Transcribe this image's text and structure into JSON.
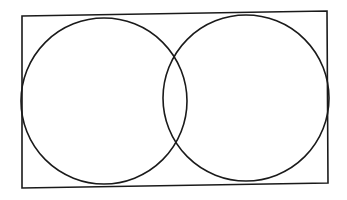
{
  "diagram": {
    "type": "venn-in-rectangle",
    "background": "#ffffff",
    "stroke": "#1a1a1a",
    "rectangle": {
      "points": "22,16 327,11 328,183 22,188"
    },
    "circles": [
      {
        "name": "left-circle",
        "cx": 104,
        "cy": 101,
        "r": 83
      },
      {
        "name": "right-circle",
        "cx": 246,
        "cy": 98,
        "r": 83
      }
    ]
  }
}
